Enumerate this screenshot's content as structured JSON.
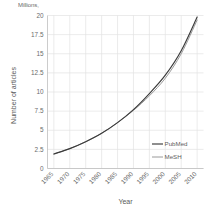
{
  "chart_data": {
    "type": "line",
    "title": "",
    "units_note": "Millions,",
    "xlabel": "Year",
    "ylabel": "Number of articles",
    "x": [
      1965,
      1970,
      1975,
      1980,
      1985,
      1990,
      1995,
      2000,
      2005,
      2010
    ],
    "xlim": [
      1963,
      2012
    ],
    "ylim": [
      0,
      20
    ],
    "ytick_labels": [
      "0",
      "2.5",
      "5",
      "7.5",
      "10",
      "12.5",
      "15",
      "17.5",
      "20"
    ],
    "ytick_values": [
      0,
      2.5,
      5,
      7.5,
      10,
      12.5,
      15,
      17.5,
      20
    ],
    "xtick_labels": [
      "1965",
      "1970",
      "1975",
      "1980",
      "1985",
      "1990",
      "1995",
      "2000",
      "2005",
      "2010"
    ],
    "grid": true,
    "legend_position": "lower-right",
    "series": [
      {
        "name": "PubMed",
        "color": "#3a3a3a",
        "values": [
          1.9,
          2.6,
          3.5,
          4.6,
          6.0,
          7.7,
          9.8,
          12.2,
          15.4,
          19.8
        ]
      },
      {
        "name": "MeSH",
        "color": "#8f8f8f",
        "values": [
          1.9,
          2.6,
          3.5,
          4.6,
          6.0,
          7.6,
          9.5,
          11.8,
          15.0,
          19.4
        ]
      }
    ],
    "colors": {
      "pubmed": "#3a3a3a",
      "mesh": "#8f8f8f",
      "grid": "#e3e3e3",
      "axis": "#bfbfbf",
      "text": "#6b6b6b",
      "background": "#ffffff"
    }
  }
}
